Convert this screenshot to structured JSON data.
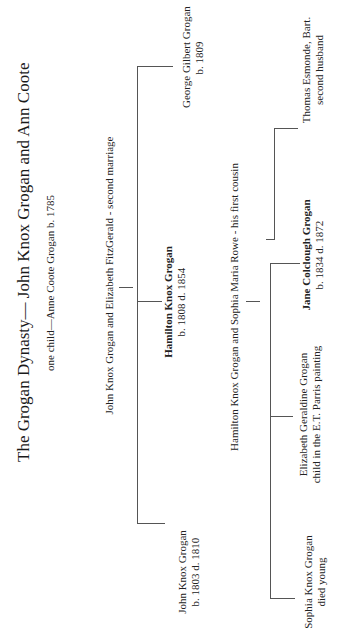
{
  "title": "The Grogan Dynasty— John Knox Grogan and Ann Coote",
  "subtitle": "one child—Anne Coote Grogan b. 1785",
  "second_marriage": {
    "label": "John Knox Grogan and Elizabeth FitzGerald  - second marriage",
    "children": [
      {
        "name": "George Gilbert Grogan",
        "dates": "b. 1809",
        "bold": false
      },
      {
        "name": "Hamilton Knox Grogan",
        "dates": "b. 1808  d. 1854",
        "bold": true
      },
      {
        "name": "John Knox Grogan",
        "dates": "b. 1803  d. 1810",
        "bold": false
      }
    ]
  },
  "hamilton_marriage": {
    "label": "Hamilton Knox Grogan and Sophia Maria Rowe  -  his first cousin",
    "spouse_link": {
      "name": "Thomas Esmonde, Bart.",
      "note": "second husband"
    },
    "children": [
      {
        "name": "Jane Colclough Grogan",
        "dates": "b. 1834  d. 1872",
        "bold": true
      },
      {
        "name": "Elizabeth Geraldine Grogan",
        "dates": "child in the E.T. Parris painting",
        "bold": false
      },
      {
        "name": "Sophia Knox Grogan",
        "dates": "died young",
        "bold": false
      }
    ]
  }
}
